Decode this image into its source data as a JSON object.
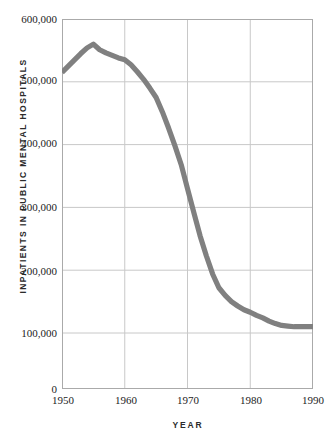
{
  "chart_data": {
    "type": "line",
    "title": "",
    "xlabel": "YEAR",
    "ylabel": "INPATIENTS IN PUBLIC MENTAL HOSPITALS",
    "xlim": [
      1950,
      1990
    ],
    "ylim": [
      0,
      600000
    ],
    "grid": true,
    "legend": null,
    "line_color": "#808080",
    "axis_color": "#aaaaaa",
    "grid_color": "#c8c8c8",
    "xticks": [
      1950,
      1960,
      1970,
      1980,
      1990
    ],
    "xtick_labels": [
      "1950",
      "1960",
      "1970",
      "1980",
      "1990"
    ],
    "yticks": [
      0,
      100000,
      200000,
      300000,
      400000,
      500000,
      600000
    ],
    "ytick_labels": [
      "0",
      "100,000",
      "200,000",
      "300,000",
      "400,000",
      "500,000",
      "600,000"
    ],
    "y_gridlines": [
      100000,
      200000,
      300000,
      400000,
      500000
    ],
    "x_gridlines": [
      1960,
      1970,
      1980
    ],
    "axis_break_note": "y-axis compressed between 0 and 100,000",
    "series": [
      {
        "name": "Inpatients in public mental hospitals",
        "x": [
          1950,
          1951,
          1952,
          1953,
          1954,
          1955,
          1956,
          1957,
          1958,
          1959,
          1960,
          1961,
          1962,
          1963,
          1964,
          1965,
          1966,
          1967,
          1968,
          1969,
          1970,
          1971,
          1972,
          1973,
          1974,
          1975,
          1976,
          1977,
          1978,
          1979,
          1980,
          1981,
          1982,
          1983,
          1984,
          1985,
          1986,
          1987,
          1988,
          1989,
          1990
        ],
        "values": [
          515000,
          525000,
          535000,
          545000,
          554000,
          560000,
          551000,
          546000,
          542000,
          538000,
          535000,
          527000,
          516000,
          504000,
          490000,
          475000,
          452000,
          426000,
          398000,
          368000,
          330000,
          292000,
          255000,
          223000,
          194000,
          172000,
          160000,
          150000,
          143000,
          137000,
          133000,
          128000,
          124000,
          119000,
          115000,
          112000,
          111000,
          110000,
          110000,
          110000,
          110000
        ]
      }
    ]
  }
}
